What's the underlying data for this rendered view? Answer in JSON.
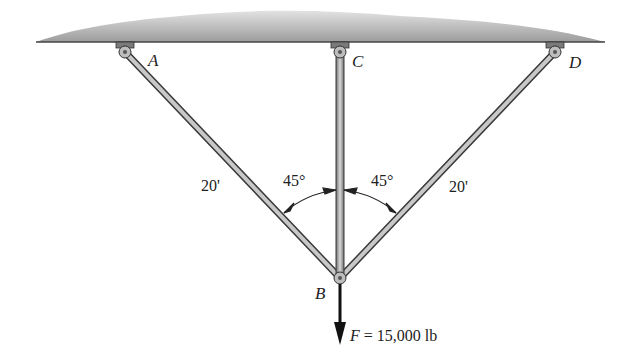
{
  "diagram": {
    "points": {
      "A": {
        "label": "A",
        "x": 125,
        "y": 52
      },
      "C": {
        "label": "C",
        "x": 340,
        "y": 52
      },
      "D": {
        "label": "D",
        "x": 555,
        "y": 52
      },
      "B": {
        "label": "B",
        "x": 340,
        "y": 278
      }
    },
    "members": [
      {
        "from": "A",
        "to": "B",
        "length_label": "20'"
      },
      {
        "from": "C",
        "to": "B",
        "length_label": ""
      },
      {
        "from": "D",
        "to": "B",
        "length_label": "20'"
      }
    ],
    "angles": [
      {
        "label": "45°",
        "between": [
          "AB",
          "CB"
        ]
      },
      {
        "label": "45°",
        "between": [
          "CB",
          "DB"
        ]
      }
    ],
    "load": {
      "symbol": "F",
      "text": " = 15,000 lb",
      "direction": "down"
    },
    "colors": {
      "ceiling": "#9a9a9a",
      "member": "#8c8c8c",
      "outline": "#3a3a3a"
    }
  }
}
